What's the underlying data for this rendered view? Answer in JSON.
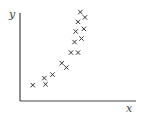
{
  "chart_data": {
    "type": "scatter",
    "title": "",
    "xlabel": "x",
    "ylabel": "y",
    "grid": false,
    "legend": null,
    "marker": "x",
    "xlim": [
      0,
      100
    ],
    "ylim": [
      0,
      100
    ],
    "points": [
      {
        "x": 11,
        "y": 18
      },
      {
        "x": 22,
        "y": 19
      },
      {
        "x": 21,
        "y": 26
      },
      {
        "x": 28,
        "y": 30
      },
      {
        "x": 36,
        "y": 43
      },
      {
        "x": 40,
        "y": 38
      },
      {
        "x": 44,
        "y": 55
      },
      {
        "x": 50,
        "y": 55
      },
      {
        "x": 47,
        "y": 67
      },
      {
        "x": 53,
        "y": 71
      },
      {
        "x": 48,
        "y": 79
      },
      {
        "x": 55,
        "y": 82
      },
      {
        "x": 50,
        "y": 90
      },
      {
        "x": 56,
        "y": 95
      },
      {
        "x": 52,
        "y": 101
      }
    ],
    "colors": {
      "axis": "#444444",
      "marker": "#333333"
    }
  }
}
